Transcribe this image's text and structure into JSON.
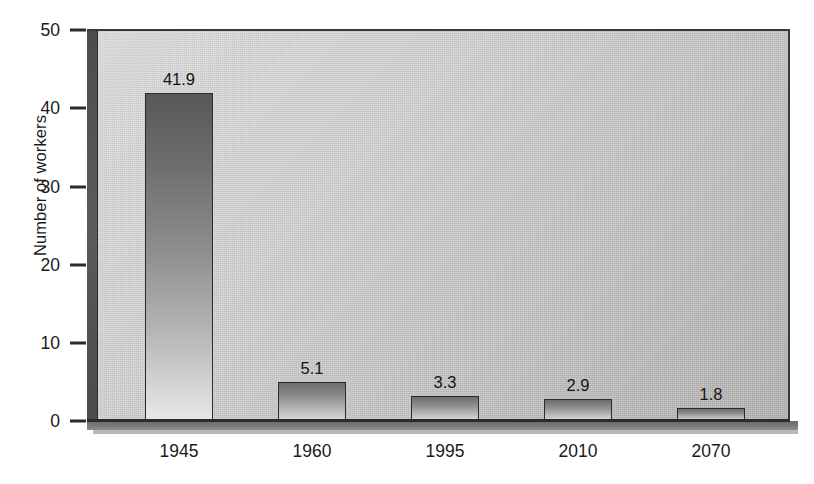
{
  "chart_data": {
    "type": "bar",
    "title": "",
    "subtitle": "",
    "xlabel": "",
    "ylabel": "Number of workers",
    "categories": [
      "1945",
      "1960",
      "1995",
      "2010",
      "2070"
    ],
    "values": [
      41.9,
      5.1,
      3.3,
      2.9,
      1.8
    ],
    "value_labels": [
      "41.9",
      "5.1",
      "3.3",
      "2.9",
      "1.8"
    ],
    "series": [
      {
        "name": "Number of workers",
        "values": [
          41.9,
          5.1,
          3.3,
          2.9,
          1.8
        ]
      }
    ],
    "ylim": [
      0,
      50
    ],
    "xlim": null,
    "yticks": [
      0,
      10,
      20,
      30,
      40,
      50
    ],
    "ytick_labels": [
      "0",
      "10",
      "20",
      "30",
      "40",
      "50"
    ],
    "grid": false,
    "legend": false,
    "legend_position": "none",
    "annotations": [],
    "colors": {
      "bar_top": "#585858",
      "bar_bottom": "#e8e8e8",
      "bar_border": "#2c2c2c",
      "plot_background_light": "#dcdcdc",
      "plot_background_dark": "#b2b2b2",
      "axis": "#2b2b2b",
      "text": "#1a1a1a",
      "sidewall": "#545454",
      "floor": "#7b7b7b",
      "page_background": "#ffffff"
    }
  }
}
